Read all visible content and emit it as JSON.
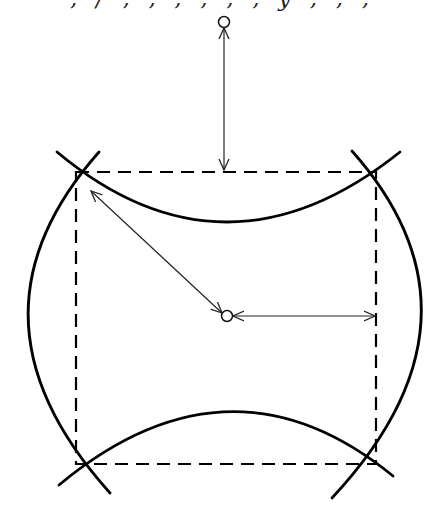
{
  "caption": {
    "text": "‚ / ‚ ‚ ‚ ‚  ‚ ‚ y ‚ ‚ ‚"
  },
  "colors": {
    "stroke": "#000000",
    "thin": "#333333",
    "background": "#ffffff"
  },
  "diagram": {
    "square": {
      "x1": 76,
      "y1": 172,
      "x2": 376,
      "y2": 464,
      "style": "dashed"
    },
    "arcs": [
      {
        "name": "top-arc",
        "d": "M 57 152 Q 225 292 400 152"
      },
      {
        "name": "bottom-arc",
        "d": "M 59 485 Q 230 343 393 476"
      },
      {
        "name": "left-arc",
        "d": "M 99 152 Q -48 318 110 493"
      },
      {
        "name": "right-arc",
        "d": "M 352 151 Q 500 318 332 498"
      }
    ],
    "points": [
      {
        "name": "top-point",
        "cx": 224,
        "cy": 22,
        "r": 5.5
      },
      {
        "name": "center-point",
        "cx": 227,
        "cy": 316,
        "r": 5.5
      }
    ],
    "arrows": [
      {
        "name": "vertical-distance-arrow",
        "x1": 224,
        "y1": 28,
        "x2": 224,
        "y2": 170
      },
      {
        "name": "radius-arrow",
        "x1": 91,
        "y1": 191,
        "x2": 222,
        "y2": 313
      },
      {
        "name": "horizontal-distance-arrow",
        "x1": 233,
        "y1": 316,
        "x2": 375,
        "y2": 316
      }
    ]
  }
}
